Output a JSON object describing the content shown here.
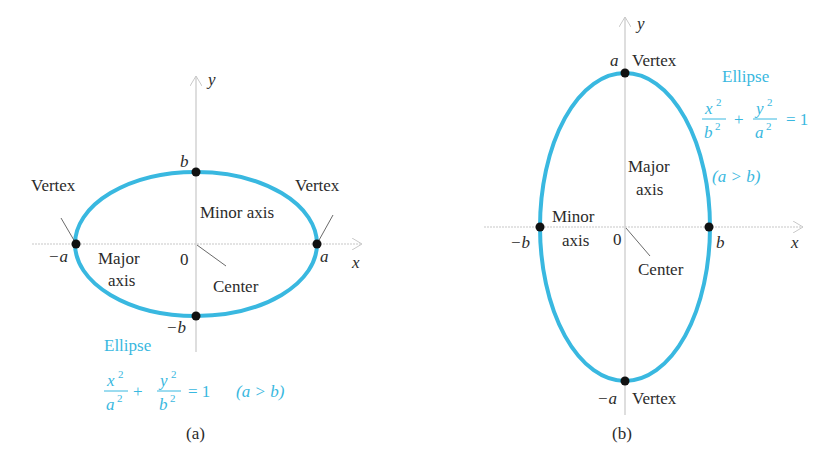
{
  "panels": [
    {
      "id": "a",
      "caption": "(a)",
      "orientation": "horizontal",
      "axes": {
        "x": "x",
        "y": "y",
        "origin": "0"
      },
      "points": {
        "right": "a",
        "left": "−a",
        "top": "b",
        "bottom": "−b"
      },
      "labels": {
        "vertex_left": "Vertex",
        "vertex_right": "Vertex",
        "minor_axis": "Minor axis",
        "major_axis_1": "Major",
        "major_axis_2": "axis",
        "center": "Center",
        "ellipse": "Ellipse"
      },
      "equation": {
        "num1": "x",
        "den1": "a",
        "num2": "y",
        "den2": "b",
        "exp": "2",
        "plus": "+",
        "equals": "= 1",
        "condition": "(a > b)"
      }
    },
    {
      "id": "b",
      "caption": "(b)",
      "orientation": "vertical",
      "axes": {
        "x": "x",
        "y": "y",
        "origin": "0"
      },
      "points": {
        "top": "a",
        "bottom": "−a",
        "right": "b",
        "left": "−b"
      },
      "labels": {
        "vertex_top": "Vertex",
        "vertex_bottom": "Vertex",
        "major_axis_1": "Major",
        "major_axis_2": "axis",
        "minor_axis_1": "Minor",
        "minor_axis_2": "axis",
        "center": "Center",
        "ellipse": "Ellipse"
      },
      "equation": {
        "num1": "x",
        "den1": "b",
        "num2": "y",
        "den2": "a",
        "exp": "2",
        "plus": "+",
        "equals": "= 1",
        "condition": "(a > b)"
      }
    }
  ],
  "colors": {
    "ellipse": "#39b8e0",
    "axis": "#c8c8c8",
    "point": "#111111",
    "text": "#2b2b2b"
  }
}
